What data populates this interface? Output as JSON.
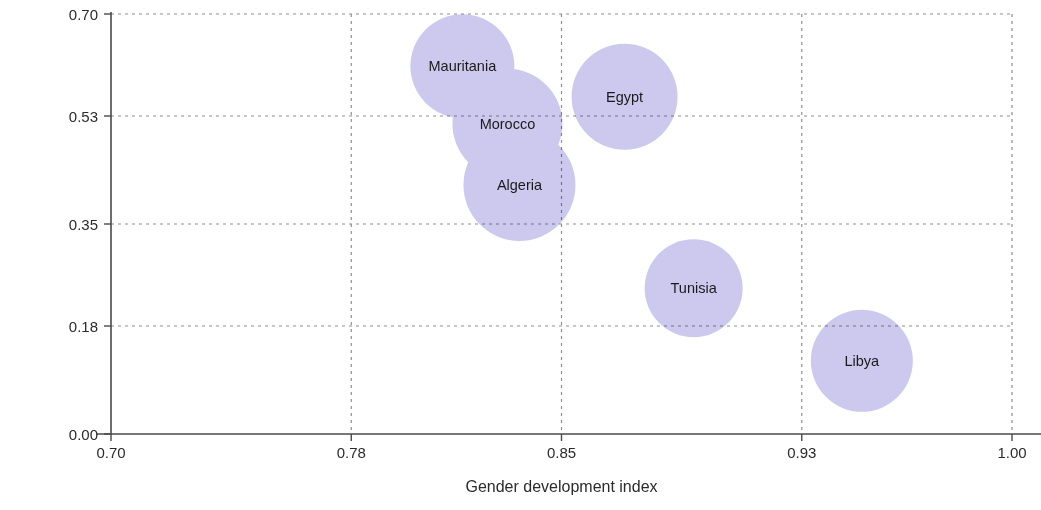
{
  "chart_data": {
    "type": "scatter",
    "title": "",
    "xlabel": "Gender development index",
    "ylabel": "Gender inequality index",
    "xlim": [
      0.7,
      1.0
    ],
    "ylim": [
      0.0,
      0.7
    ],
    "xticks": [
      "0.70",
      "0.78",
      "0.85",
      "0.93",
      "1.00"
    ],
    "xtick_values": [
      0.7,
      0.78,
      0.85,
      0.93,
      1.0
    ],
    "yticks": [
      "0.00",
      "0.18",
      "0.35",
      "0.53",
      "0.70"
    ],
    "ytick_values": [
      0.0,
      0.18,
      0.35,
      0.53,
      0.7
    ],
    "grid": "dotted",
    "legend": "none",
    "bubble_color": "#cdc9ee",
    "bubble_overlap_color": "#b0a0d8",
    "series": [
      {
        "name": "Countries",
        "points": [
          {
            "label": "Mauritania",
            "x": 0.817,
            "y": 0.613,
            "size": 52
          },
          {
            "label": "Morocco",
            "x": 0.832,
            "y": 0.517,
            "size": 55
          },
          {
            "label": "Algeria",
            "x": 0.836,
            "y": 0.415,
            "size": 56
          },
          {
            "label": "Egypt",
            "x": 0.871,
            "y": 0.562,
            "size": 53
          },
          {
            "label": "Tunisia",
            "x": 0.894,
            "y": 0.243,
            "size": 49
          },
          {
            "label": "Libya",
            "x": 0.95,
            "y": 0.122,
            "size": 51
          }
        ]
      }
    ]
  },
  "axes": {
    "x_title": "Gender development index",
    "y_title": "Gender inequality index"
  },
  "colors": {
    "bubble": "#cdc9ee",
    "axis": "#4a4a4a",
    "grid": "#8f8f8f",
    "text": "#2b2b2b"
  }
}
